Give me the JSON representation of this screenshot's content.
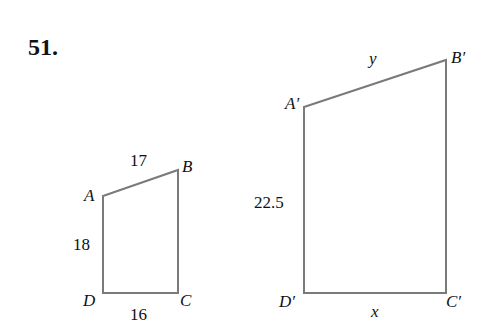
{
  "problem": {
    "number_label": "51."
  },
  "figures": [
    {
      "name": "ABCD",
      "vertices": {
        "A": {
          "label": "A",
          "x": 103,
          "y": 196
        },
        "B": {
          "label": "B",
          "x": 178,
          "y": 170
        },
        "C": {
          "label": "C",
          "x": 178,
          "y": 293
        },
        "D": {
          "label": "D",
          "x": 103,
          "y": 293
        }
      },
      "side_labels": {
        "AB": "17",
        "AD": "18",
        "DC": "16"
      }
    },
    {
      "name": "A'B'C'D'",
      "vertices": {
        "A": {
          "label": "A′",
          "x": 304,
          "y": 107
        },
        "B": {
          "label": "B′",
          "x": 446,
          "y": 60
        },
        "C": {
          "label": "C′",
          "x": 446,
          "y": 293
        },
        "D": {
          "label": "D′",
          "x": 304,
          "y": 293
        }
      },
      "side_labels": {
        "AB": "y",
        "AD": "22.5",
        "DC": "x"
      }
    }
  ],
  "colors": {
    "edge": "#7a7a7a",
    "text": "#111111",
    "background": "#ffffff"
  }
}
